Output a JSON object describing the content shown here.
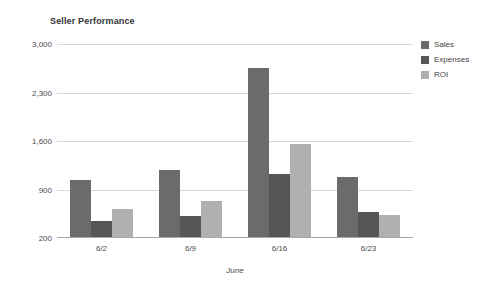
{
  "chart_data": {
    "type": "bar",
    "title": "Seller Performance",
    "xlabel": "June",
    "ylabel": "",
    "categories": [
      "6/2",
      "6/9",
      "6/16",
      "6/23"
    ],
    "series": [
      {
        "name": "Sales",
        "color": "#6b6b6b",
        "values": [
          1040,
          1180,
          2650,
          1080
        ]
      },
      {
        "name": "Expenses",
        "color": "#565656",
        "values": [
          450,
          520,
          1130,
          570
        ]
      },
      {
        "name": "ROI",
        "color": "#b0b0b0",
        "values": [
          620,
          730,
          1560,
          530
        ]
      }
    ],
    "ylim": [
      200,
      3000
    ],
    "yticks": [
      200,
      900,
      1600,
      2300,
      3000
    ],
    "ytick_labels": [
      "200",
      "900",
      "1,600",
      "2,300",
      "3,000"
    ],
    "grid": true,
    "legend_position": "right",
    "background_color": "#ffffff",
    "gridline_color": "#d8d8d8",
    "axis_color": "#a8a8a8"
  }
}
